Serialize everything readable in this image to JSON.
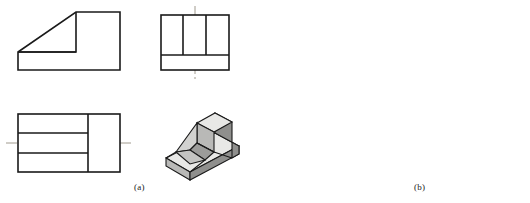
{
  "figure": {
    "background_color": "#ffffff",
    "line_color": "#1a1a1a",
    "hidden_line_color": "#8c8c8c",
    "center_line_color": "#a09a8e",
    "shade_light": "#e8e8e6",
    "shade_mid": "#b9b9b7",
    "shade_dark": "#8f8f8d",
    "width": 530,
    "height": 203
  },
  "parts": [
    {
      "id": "a",
      "caption": "(a)",
      "views": [
        {
          "name": "front-view",
          "label": "front view",
          "x": 18,
          "y": 12,
          "w": 102,
          "h": 58,
          "hidden_lines": false,
          "features": "inclined surface from lower-left to upper-right with vertical riser and horizontal base"
        },
        {
          "name": "side-view",
          "label": "side view",
          "x": 161,
          "y": 15,
          "w": 68,
          "h": 55,
          "vertical_divisions": [
            183,
            206
          ],
          "horizontal_division": 55,
          "center_line_x": 195
        },
        {
          "name": "top-view",
          "label": "top view",
          "x": 18,
          "y": 114,
          "w": 102,
          "h": 58,
          "horizontal_divisions": [
            133,
            153
          ],
          "vertical_division": 88,
          "center_line_y": 143
        },
        {
          "name": "isometric-view",
          "label": "isometric pictorial",
          "x": 163,
          "y": 113,
          "w": 76,
          "h": 70
        }
      ]
    },
    {
      "id": "b",
      "caption": "(b)",
      "views": [
        {
          "name": "front-view",
          "label": "front view",
          "x": 312,
          "y": 12,
          "w": 100,
          "h": 58,
          "hidden_lines": true,
          "hidden_horizontal_y": 52,
          "hidden_vertical_x": 378,
          "features": "inclined surface with hidden edges shown dashed"
        },
        {
          "name": "side-view",
          "label": "side view",
          "x": 455,
          "y": 15,
          "w": 67,
          "h": 55,
          "vertical_divisions": [
            475,
            504
          ],
          "horizontal_division": 56,
          "center_line_x": 489
        },
        {
          "name": "top-view",
          "label": "top view",
          "x": 312,
          "y": 114,
          "w": 100,
          "h": 58,
          "horizontal_divisions": [
            133,
            153
          ],
          "vertical_division": 378,
          "center_line_y": 143
        },
        {
          "name": "isometric-view",
          "label": "isometric pictorial",
          "x": 443,
          "y": 113,
          "w": 78,
          "h": 70
        }
      ]
    }
  ]
}
